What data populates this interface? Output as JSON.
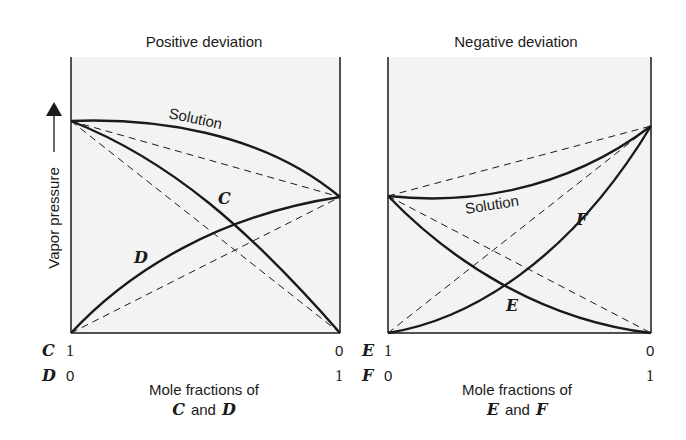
{
  "panels": [
    {
      "title": "Positive deviation",
      "curve_labels": {
        "solution": "Solution",
        "component_a": "C",
        "component_b": "D"
      },
      "x_axis": {
        "row1": {
          "component": "C",
          "left": "1",
          "right": "0"
        },
        "row2": {
          "component": "D",
          "left": "0",
          "right": "1"
        },
        "caption_line1": "Mole fractions of",
        "caption_line2_a": "C",
        "caption_line2_and": "and",
        "caption_line2_b": "D"
      }
    },
    {
      "title": "Negative deviation",
      "curve_labels": {
        "solution": "Solution",
        "component_a": "E",
        "component_b": "F"
      },
      "x_axis": {
        "row1": {
          "component": "E",
          "left": "1",
          "right": "0"
        },
        "row2": {
          "component": "F",
          "left": "0",
          "right": "1"
        },
        "caption_line1": "Mole fractions of",
        "caption_line2_a": "E",
        "caption_line2_and": "and",
        "caption_line2_b": "F"
      }
    }
  ],
  "y_axis_label": "Vapor pressure",
  "colors": {
    "plot_bg": "#f3f3f3",
    "line": "#1a1a1a"
  }
}
